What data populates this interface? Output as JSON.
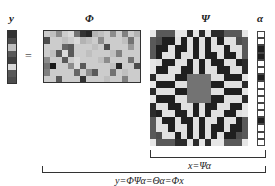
{
  "labels": {
    "y": "y",
    "phi": "Φ",
    "psi": "Ψ",
    "alpha": "α",
    "equals": "="
  },
  "equations": {
    "inner": "x=Ψα",
    "outer": "y=ΦΨα=Θα=Φx"
  },
  "colors": {
    "line": "#333333",
    "background": "#ffffff"
  },
  "y_vector": {
    "rows": 8,
    "values": [
      0.2,
      0.3,
      0.75,
      0.35,
      0.25,
      0.85,
      0.35,
      0.3
    ]
  },
  "phi_matrix": {
    "rows": 8,
    "cols": 16,
    "values": [
      [
        0.8,
        0.75,
        0.55,
        0.8,
        0.85,
        0.45,
        0.2,
        0.15,
        0.7,
        0.75,
        0.8,
        0.55,
        0.8,
        0.5,
        0.8,
        0.7
      ],
      [
        0.3,
        0.8,
        0.8,
        0.75,
        0.8,
        0.85,
        0.7,
        0.75,
        0.8,
        0.55,
        0.8,
        0.8,
        0.8,
        0.75,
        0.45,
        0.8
      ],
      [
        0.8,
        0.8,
        0.8,
        0.4,
        0.35,
        0.8,
        0.8,
        0.8,
        0.75,
        0.8,
        0.3,
        0.8,
        0.8,
        0.8,
        0.6,
        0.8
      ],
      [
        0.8,
        0.75,
        0.35,
        0.85,
        0.35,
        0.8,
        0.8,
        0.75,
        0.8,
        0.8,
        0.8,
        0.75,
        0.5,
        0.8,
        0.8,
        0.8
      ],
      [
        0.55,
        0.8,
        0.8,
        0.35,
        0.8,
        0.85,
        0.8,
        0.8,
        0.8,
        0.75,
        0.55,
        0.8,
        0.8,
        0.8,
        0.45,
        0.8
      ],
      [
        0.45,
        0.1,
        0.8,
        0.8,
        0.55,
        0.85,
        0.35,
        0.8,
        0.8,
        0.8,
        0.8,
        0.75,
        0.15,
        0.8,
        0.8,
        0.3
      ],
      [
        0.5,
        0.8,
        0.8,
        0.8,
        0.8,
        0.4,
        0.8,
        0.55,
        0.35,
        0.8,
        0.8,
        0.45,
        0.8,
        0.75,
        0.8,
        0.8
      ],
      [
        0.8,
        0.8,
        0.35,
        0.8,
        0.8,
        0.8,
        0.2,
        0.8,
        0.8,
        0.8,
        0.75,
        0.8,
        0.8,
        0.5,
        0.8,
        0.8
      ]
    ]
  },
  "psi_matrix": {
    "rows": 16,
    "cols": 16,
    "pattern": "concentric checkered rings"
  },
  "alpha_vector": {
    "rows": 16,
    "nonzero_indices": [
      2,
      3,
      6,
      12
    ]
  }
}
